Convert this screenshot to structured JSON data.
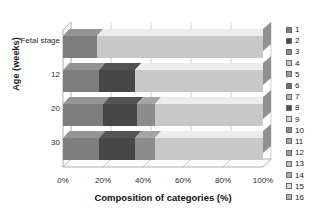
{
  "chart_data": {
    "type": "bar",
    "orientation": "horizontal",
    "stacked": true,
    "style": "3d-stacked-bar",
    "title": "",
    "xlabel": "Composition of categories (%)",
    "ylabel": "Age (weeks)",
    "xlim": [
      0,
      100
    ],
    "xticklabels": [
      "0%",
      "20%",
      "40%",
      "60%",
      "80%",
      "100%"
    ],
    "xtickvalues": [
      0,
      20,
      40,
      60,
      80,
      100
    ],
    "grid": true,
    "legend_position": "right",
    "categories": [
      "Fetal stage",
      "12",
      "20",
      "30"
    ],
    "legend": [
      "1",
      "2",
      "3",
      "4",
      "5",
      "6",
      "7",
      "8",
      "9",
      "10",
      "11",
      "12",
      "13",
      "14",
      "15",
      "16"
    ],
    "series": [
      {
        "name": "1",
        "color": "#7d7d7d",
        "values": [
          17,
          18,
          20,
          18
        ]
      },
      {
        "name": "2",
        "color": "#474747",
        "values": [
          0,
          18,
          17,
          18
        ]
      },
      {
        "name": "3",
        "color": "#8c8c8c",
        "values": [
          0,
          0,
          9,
          10
        ]
      },
      {
        "name": "4",
        "color": "#c8c8c8",
        "values": [
          83,
          64,
          54,
          54
        ]
      },
      {
        "name": "5",
        "color": "#9a9a9a",
        "values": [
          0,
          0,
          0,
          0
        ]
      },
      {
        "name": "6",
        "color": "#6b6b6b",
        "values": [
          0,
          0,
          0,
          0
        ]
      },
      {
        "name": "7",
        "color": "#b5b5b5",
        "values": [
          0,
          0,
          0,
          0
        ]
      },
      {
        "name": "8",
        "color": "#4f4f4f",
        "values": [
          0,
          0,
          0,
          0
        ]
      },
      {
        "name": "9",
        "color": "#d4d4d4",
        "values": [
          0,
          0,
          0,
          0
        ]
      },
      {
        "name": "10",
        "color": "#8a8a8a",
        "values": [
          0,
          0,
          0,
          0
        ]
      },
      {
        "name": "11",
        "color": "#a6a6a6",
        "values": [
          0,
          0,
          0,
          0
        ]
      },
      {
        "name": "12",
        "color": "#9e9e9e",
        "values": [
          0,
          0,
          0,
          0
        ]
      },
      {
        "name": "13",
        "color": "#c0c0c0",
        "values": [
          0,
          0,
          0,
          0
        ]
      },
      {
        "name": "14",
        "color": "#adadad",
        "values": [
          0,
          0,
          0,
          0
        ]
      },
      {
        "name": "15",
        "color": "#dcdcdc",
        "values": [
          0,
          0,
          0,
          0
        ]
      },
      {
        "name": "16",
        "color": "#b0b0b0",
        "values": [
          0,
          0,
          0,
          0
        ]
      }
    ]
  },
  "axes": {
    "x_title": "Composition of categories (%)",
    "y_title": "Age (weeks)"
  }
}
